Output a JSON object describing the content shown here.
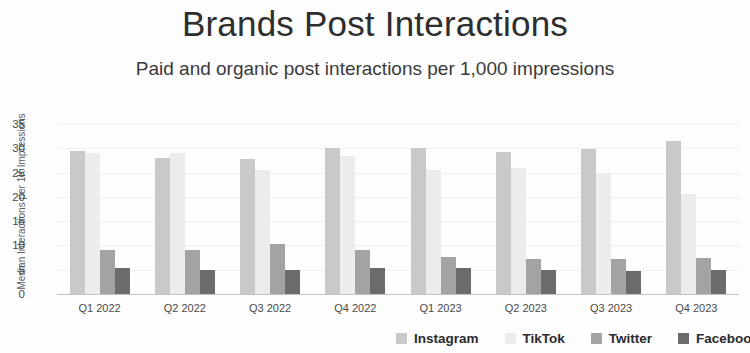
{
  "chart_data": {
    "type": "bar",
    "title": "Brands Post Interactions",
    "subtitle": "Paid and organic post interactions per 1,000 impressions",
    "xlabel": "",
    "ylabel": "Median Interactions per 1K Impressions",
    "ylim": [
      0,
      35
    ],
    "yticks": [
      0,
      5,
      10,
      15,
      20,
      25,
      30,
      35
    ],
    "grid": true,
    "legend_position": "bottom-right",
    "categories": [
      "Q1 2022",
      "Q2 2022",
      "Q3 2022",
      "Q4 2022",
      "Q1 2023",
      "Q2 2023",
      "Q3 2023",
      "Q4 2023"
    ],
    "series": [
      {
        "name": "Instagram",
        "color": "#c9c9c9",
        "values": [
          29.5,
          28.0,
          27.8,
          30.0,
          30.0,
          29.3,
          29.8,
          31.5
        ]
      },
      {
        "name": "TikTok",
        "color": "#ececec",
        "values": [
          29.0,
          29.0,
          25.5,
          28.5,
          25.5,
          26.0,
          25.0,
          20.5
        ]
      },
      {
        "name": "Twitter",
        "color": "#a3a3a3",
        "values": [
          9.0,
          9.0,
          10.3,
          9.0,
          7.7,
          7.3,
          7.2,
          7.5
        ]
      },
      {
        "name": "Facebook",
        "color": "#6b6b6b",
        "values": [
          5.3,
          5.0,
          5.0,
          5.3,
          5.3,
          5.0,
          4.7,
          5.0
        ]
      }
    ]
  }
}
